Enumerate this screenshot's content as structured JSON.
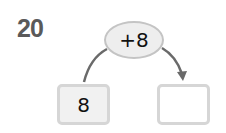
{
  "problem": {
    "number": "20",
    "operation": "+8",
    "input_value": "8",
    "output_value": ""
  }
}
